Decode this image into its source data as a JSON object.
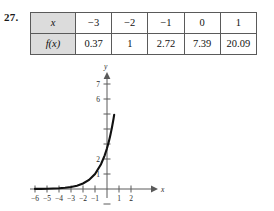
{
  "problem": {
    "number": "27."
  },
  "table": {
    "rows": [
      {
        "header": "x",
        "cells": [
          "−3",
          "−2",
          "−1",
          "0",
          "1"
        ]
      },
      {
        "header": "f(x)",
        "cells": [
          "0.37",
          "1",
          "2.72",
          "7.39",
          "20.09"
        ]
      }
    ]
  },
  "chart_data": {
    "type": "line",
    "title": "",
    "xlabel": "x",
    "ylabel": "y",
    "xlim": [
      -6.6,
      2.9
    ],
    "ylim": [
      -0.9,
      8.0
    ],
    "grid": false,
    "legend": null,
    "x_ticks": [
      -6,
      -5,
      -4,
      -3,
      -2,
      -1,
      1,
      2
    ],
    "x_tick_labels": [
      "−6",
      "−5",
      "−4",
      "−3",
      "−2",
      "−1",
      "1",
      "2"
    ],
    "y_ticks": [
      1,
      2,
      3,
      4,
      5,
      6,
      7
    ],
    "y_tick_labels": [
      "1",
      "2",
      "",
      "",
      "",
      "6",
      "7"
    ],
    "series": [
      {
        "name": "f(x)",
        "x": [
          -6,
          -5.5,
          -5,
          -4.5,
          -4,
          -3.5,
          -3,
          -2.5,
          -2,
          -1.5,
          -1,
          -0.5,
          -0.2,
          0,
          0.1
        ],
        "y": [
          0.007,
          0.011,
          0.018,
          0.03,
          0.05,
          0.082,
          0.135,
          0.223,
          0.368,
          0.607,
          1.0,
          1.649,
          2.226,
          2.718,
          3.004
        ]
      }
    ],
    "points_from_table": {
      "x": [
        -3,
        -2,
        -1,
        0,
        1
      ],
      "y": [
        0.37,
        1,
        2.72,
        7.39,
        20.09
      ]
    },
    "colors": {
      "curve": "#111111",
      "axis": "#5a5a5a"
    }
  }
}
